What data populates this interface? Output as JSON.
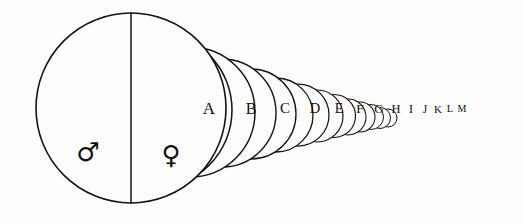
{
  "figure": {
    "background_color": "#fdfdfc",
    "ink_color": "#15120f",
    "width": 523,
    "height": 224
  },
  "main_circle": {
    "name": "primary-circle",
    "center_x": 131,
    "center_y": 108,
    "radius": 95,
    "stroke_width": 1.6,
    "divider": {
      "label": "vertical-diameter",
      "x": 131,
      "y_top": 13,
      "y_bottom": 203,
      "stroke_width": 1.5
    }
  },
  "symbols": [
    {
      "name": "mars-symbol",
      "glyph": "♂",
      "meaning": "male",
      "x": 88,
      "y": 153,
      "font_size": 26
    },
    {
      "name": "venus-symbol",
      "glyph": "♀",
      "meaning": "female",
      "x": 171,
      "y": 156,
      "font_size": 26
    }
  ],
  "series": {
    "label_row_y": 110,
    "count": 13,
    "circles": [
      {
        "label": "A",
        "cx": 154,
        "cy": 110,
        "r": 78,
        "label_x": 209,
        "font_size": 17,
        "stroke_width": 1.5
      },
      {
        "label": "B",
        "cx": 190,
        "cy": 112,
        "r": 65,
        "label_x": 251,
        "font_size": 16,
        "stroke_width": 1.45
      },
      {
        "label": "C",
        "cx": 222,
        "cy": 113,
        "r": 54,
        "label_x": 285,
        "font_size": 15,
        "stroke_width": 1.4
      },
      {
        "label": "D",
        "cx": 251,
        "cy": 114,
        "r": 45,
        "label_x": 315,
        "font_size": 14.5,
        "stroke_width": 1.35
      },
      {
        "label": "E",
        "cx": 276,
        "cy": 115,
        "r": 37,
        "label_x": 339,
        "font_size": 14,
        "stroke_width": 1.3
      },
      {
        "label": "F",
        "cx": 298,
        "cy": 115,
        "r": 31,
        "label_x": 360,
        "font_size": 13.5,
        "stroke_width": 1.25
      },
      {
        "label": "G",
        "cx": 317,
        "cy": 116,
        "r": 26,
        "label_x": 379,
        "font_size": 13,
        "stroke_width": 1.2
      },
      {
        "label": "H",
        "cx": 334,
        "cy": 116,
        "r": 21.5,
        "label_x": 396,
        "font_size": 12.5,
        "stroke_width": 1.15
      },
      {
        "label": "I",
        "cx": 348,
        "cy": 117,
        "r": 18,
        "label_x": 411,
        "font_size": 12,
        "stroke_width": 1.1
      },
      {
        "label": "J",
        "cx": 360,
        "cy": 117,
        "r": 15,
        "label_x": 425,
        "font_size": 11.5,
        "stroke_width": 1.05
      },
      {
        "label": "K",
        "cx": 371,
        "cy": 117,
        "r": 12.5,
        "label_x": 438,
        "font_size": 11,
        "stroke_width": 1
      },
      {
        "label": "L",
        "cx": 380,
        "cy": 118,
        "r": 10.5,
        "label_x": 450,
        "font_size": 10.5,
        "stroke_width": 1
      },
      {
        "label": "M",
        "cx": 388,
        "cy": 118,
        "r": 9,
        "label_x": 462,
        "font_size": 10,
        "stroke_width": 1
      }
    ]
  }
}
